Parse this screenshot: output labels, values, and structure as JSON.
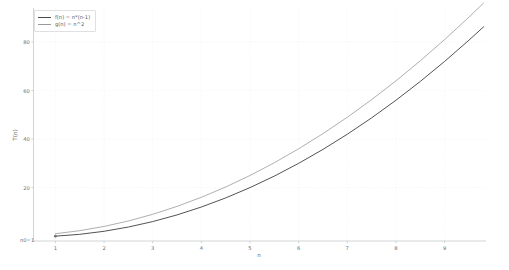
{
  "chart_data": {
    "type": "line",
    "title": "",
    "xlabel": "n",
    "ylabel": "T(n)",
    "xlim": [
      0.55,
      9.85
    ],
    "ylim": [
      -2.0,
      94.0
    ],
    "grid": true,
    "legend_position": "upper left",
    "x_ticks": [
      "1",
      "2",
      "3",
      "4",
      "5",
      "6",
      "7",
      "8",
      "9"
    ],
    "x_tick_values": [
      1,
      2,
      3,
      4,
      5,
      6,
      7,
      8,
      9
    ],
    "y_ticks": [
      "20",
      "40",
      "60",
      "80"
    ],
    "y_tick_values": [
      20,
      40,
      60,
      80
    ],
    "annotations": [
      {
        "name": "n0-marker",
        "text": "n0=1",
        "x": 1,
        "y": 0
      }
    ],
    "series": [
      {
        "name": "f(n) = n*(n-1)",
        "color": "#4a4a4a",
        "x": [
          1.0,
          1.5,
          2.0,
          2.5,
          3.0,
          3.5,
          4.0,
          4.5,
          5.0,
          5.5,
          6.0,
          6.5,
          7.0,
          7.5,
          8.0,
          8.5,
          9.0,
          9.5,
          9.8
        ],
        "values": [
          0.0,
          0.75,
          2.0,
          3.75,
          6.0,
          8.75,
          12.0,
          15.75,
          20.0,
          24.75,
          30.0,
          35.75,
          42.0,
          48.75,
          56.0,
          63.75,
          72.0,
          80.75,
          86.24
        ]
      },
      {
        "name": "g(n) = n^2",
        "color": "#9a9a9a",
        "x": [
          1.0,
          1.5,
          2.0,
          2.5,
          3.0,
          3.5,
          4.0,
          4.5,
          5.0,
          5.5,
          6.0,
          6.5,
          7.0,
          7.5,
          8.0,
          8.5,
          9.0,
          9.5,
          9.8
        ],
        "values": [
          1.0,
          2.25,
          4.0,
          6.25,
          9.0,
          12.25,
          16.0,
          20.25,
          25.0,
          30.25,
          36.0,
          42.25,
          49.0,
          56.25,
          64.0,
          72.25,
          81.0,
          90.25,
          96.04
        ]
      }
    ]
  },
  "figure": {
    "background_color": "#ffffff",
    "axis_color": "#c8c9cb",
    "grid_color": "#ededee",
    "text_color": "#5b5e62"
  }
}
